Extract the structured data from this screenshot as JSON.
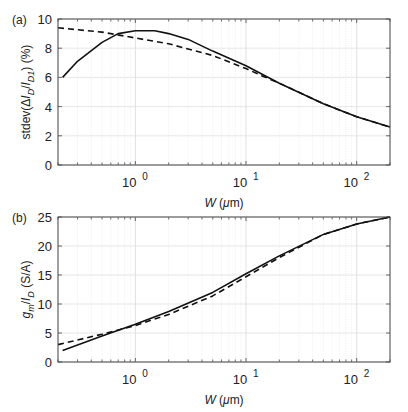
{
  "chart_data": [
    {
      "type": "line",
      "panel_label": "(a)",
      "xlabel": "W (μm)",
      "ylabel": "stdev(ΔI_D/I_D1) (%)",
      "xscale": "log",
      "xlim": [
        0.2,
        200
      ],
      "ylim": [
        0,
        10
      ],
      "xticks": [
        "10^0",
        "10^1",
        "10^2"
      ],
      "yticks": [
        0,
        2,
        4,
        6,
        8,
        10
      ],
      "grid": true,
      "series": [
        {
          "name": "solid",
          "style": "solid",
          "x": [
            0.22,
            0.3,
            0.5,
            0.7,
            1.0,
            1.5,
            2,
            3,
            5,
            10,
            20,
            50,
            100,
            200
          ],
          "y": [
            6.0,
            7.1,
            8.4,
            9.0,
            9.2,
            9.2,
            9.0,
            8.6,
            7.8,
            6.8,
            5.6,
            4.2,
            3.3,
            2.6
          ]
        },
        {
          "name": "dashed",
          "style": "dashed",
          "x": [
            0.2,
            0.5,
            1.0,
            2,
            5,
            10,
            14,
            20,
            50,
            100,
            200
          ],
          "y": [
            9.4,
            9.1,
            8.7,
            8.3,
            7.5,
            6.6,
            6.1,
            5.6,
            4.2,
            3.3,
            2.6
          ]
        }
      ]
    },
    {
      "type": "line",
      "panel_label": "(b)",
      "xlabel": "W (μm)",
      "ylabel": "g_m/I_D (S/A)",
      "xscale": "log",
      "xlim": [
        0.2,
        200
      ],
      "ylim": [
        0,
        25
      ],
      "xticks": [
        "10^0",
        "10^1",
        "10^2"
      ],
      "yticks": [
        0,
        5,
        10,
        15,
        20,
        25
      ],
      "grid": true,
      "series": [
        {
          "name": "solid",
          "style": "solid",
          "x": [
            0.22,
            0.5,
            1.0,
            2,
            5,
            10,
            20,
            50,
            100,
            200
          ],
          "y": [
            2.0,
            4.5,
            6.5,
            8.7,
            12.0,
            15.2,
            18.3,
            22.0,
            23.8,
            25.0
          ]
        },
        {
          "name": "dashed",
          "style": "dashed",
          "x": [
            0.2,
            0.5,
            1.0,
            2,
            5,
            10,
            20,
            50,
            100,
            200
          ],
          "y": [
            3.0,
            4.8,
            6.3,
            8.2,
            11.4,
            14.7,
            18.0,
            22.0,
            23.8,
            25.0
          ]
        }
      ]
    }
  ]
}
